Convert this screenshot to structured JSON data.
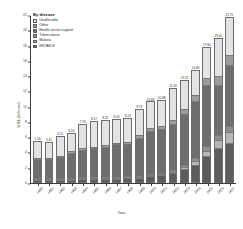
{
  "chart_data": {
    "type": "bar",
    "subtype": "stacked-bar",
    "title": "",
    "xlabel": "Year",
    "ylabel": "US$ (billions)",
    "ylim": [
      0,
      22
    ],
    "ytick_step": 2,
    "ytick_labels": [
      "0",
      "2",
      "4",
      "6",
      "8",
      "10",
      "12",
      "14",
      "16",
      "18",
      "20",
      "22"
    ],
    "grid": false,
    "legend_position": "top-left",
    "legend_title": "By disease",
    "categories": [
      "1990",
      "1991",
      "1992",
      "1993",
      "1994",
      "1995",
      "1996",
      "1997",
      "1998",
      "1999",
      "2000",
      "2001",
      "2002",
      "2003",
      "2004",
      "2005",
      "2006",
      "2007"
    ],
    "series": [
      {
        "name": "HIV/AIDS",
        "color": "#5c5c5c",
        "values": [
          0.12,
          0.14,
          0.17,
          0.21,
          0.25,
          0.28,
          0.3,
          0.33,
          0.38,
          0.45,
          0.62,
          0.78,
          1.05,
          1.55,
          2.2,
          3.35,
          4.35,
          5.1
        ]
      },
      {
        "name": "Malaria",
        "color": "#b6b6b6",
        "values": [
          0.05,
          0.05,
          0.06,
          0.07,
          0.07,
          0.08,
          0.08,
          0.09,
          0.1,
          0.12,
          0.15,
          0.18,
          0.22,
          0.3,
          0.45,
          0.7,
          1.05,
          1.35
        ]
      },
      {
        "name": "Tuberculosis",
        "color": "#8f8f8f",
        "values": [
          0.03,
          0.04,
          0.04,
          0.05,
          0.05,
          0.06,
          0.06,
          0.07,
          0.08,
          0.1,
          0.13,
          0.16,
          0.2,
          0.28,
          0.4,
          0.55,
          0.7,
          0.85
        ]
      },
      {
        "name": "Health sector support",
        "color": "#6e6e6e",
        "values": [
          2.7,
          2.67,
          2.93,
          3.47,
          3.83,
          3.92,
          4.1,
          4.41,
          4.42,
          5.13,
          5.8,
          5.88,
          6.13,
          6.87,
          7.65,
          8.2,
          6.7,
          8.1
        ]
      },
      {
        "name": "Other",
        "color": "#9c9c9c",
        "values": [
          0.15,
          0.15,
          0.17,
          0.2,
          0.22,
          0.23,
          0.24,
          0.26,
          0.28,
          0.32,
          0.38,
          0.42,
          0.5,
          0.62,
          0.75,
          0.95,
          1.15,
          1.35
        ]
      },
      {
        "name": "Unallocable",
        "color": "#e3e3e3",
        "values": [
          2.51,
          2.37,
          2.74,
          2.53,
          3.34,
          3.55,
          3.44,
          3.25,
          3.26,
          3.61,
          3.6,
          3.46,
          4.3,
          3.9,
          3.35,
          4.05,
          5.05,
          4.95
        ]
      }
    ],
    "bar_total_labels": [
      "5.56",
      "5.42",
      "6.11",
      "6.53",
      "7.76",
      "8.12",
      "8.22",
      "8.41",
      "8.52",
      "9.73",
      "10.68",
      "10.88",
      "12.40",
      "13.52",
      "14.80",
      "17.80",
      "19.00",
      "21.70"
    ]
  },
  "legend": {
    "title": "By disease",
    "items": [
      {
        "label": "Unallocable",
        "color": "#e3e3e3"
      },
      {
        "label": "Other",
        "color": "#9c9c9c"
      },
      {
        "label": "Health sector support",
        "color": "#6e6e6e"
      },
      {
        "label": "Tuberculosis",
        "color": "#8f8f8f"
      },
      {
        "label": "Malaria",
        "color": "#b6b6b6"
      },
      {
        "label": "HIV/AIDS",
        "color": "#5c5c5c"
      }
    ]
  },
  "axes": {
    "x_title": "Year",
    "y_title": "US$ (billions)"
  }
}
